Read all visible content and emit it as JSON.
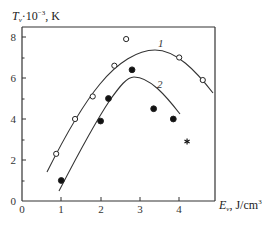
{
  "chart_data": {
    "type": "scatter",
    "title": "",
    "xlabel": "E_v, J/cm³",
    "ylabel": "T_v·10⁻³, K",
    "xlim": [
      0,
      4.9
    ],
    "ylim": [
      0,
      8.5
    ],
    "x_ticks": [
      "0",
      "1",
      "2",
      "3",
      "4"
    ],
    "y_ticks": [
      "0",
      "2",
      "4",
      "6",
      "8"
    ],
    "grid": false,
    "legend": null,
    "series": [
      {
        "name": "1",
        "marker": "open-circle",
        "points": [
          [
            0.87,
            2.3
          ],
          [
            1.35,
            4.0
          ],
          [
            1.8,
            5.1
          ],
          [
            2.35,
            6.6
          ],
          [
            2.65,
            7.9
          ],
          [
            4.0,
            7.0
          ],
          [
            4.6,
            5.9
          ]
        ]
      },
      {
        "name": "2",
        "marker": "filled-circle",
        "points": [
          [
            1.0,
            1.0
          ],
          [
            2.0,
            3.9
          ],
          [
            2.2,
            5.0
          ],
          [
            2.8,
            6.4
          ],
          [
            3.35,
            4.5
          ],
          [
            3.85,
            4.0
          ]
        ]
      },
      {
        "name": "asterisk",
        "marker": "asterisk",
        "points": [
          [
            4.2,
            2.9
          ]
        ]
      }
    ],
    "curves": [
      {
        "label": "1",
        "approx_points": [
          [
            0.64,
            1.4
          ],
          [
            1.5,
            4.3
          ],
          [
            2.5,
            6.6
          ],
          [
            3.4,
            7.3
          ],
          [
            4.0,
            6.8
          ],
          [
            4.86,
            5.3
          ]
        ]
      },
      {
        "label": "2",
        "approx_points": [
          [
            0.94,
            0.5
          ],
          [
            1.6,
            3.3
          ],
          [
            2.2,
            5.1
          ],
          [
            2.85,
            6.05
          ],
          [
            3.5,
            5.3
          ],
          [
            4.02,
            4.3
          ]
        ]
      }
    ]
  },
  "axes": {
    "x_label_main": "E",
    "x_label_sub": "v",
    "x_label_rest": ", J/cm",
    "x_label_sup": "3",
    "y_label_main": "T",
    "y_label_sub": "v",
    "y_label_mid": "·10",
    "y_label_sup": "−3",
    "y_label_rest": ", K"
  },
  "labels": {
    "curve1": "1",
    "curve2": "2",
    "x_tick_0": "0",
    "x_tick_1": "1",
    "x_tick_2": "2",
    "x_tick_3": "3",
    "x_tick_4": "4",
    "y_tick_0": "0",
    "y_tick_2": "2",
    "y_tick_4": "4",
    "y_tick_6": "6",
    "y_tick_8": "8"
  }
}
